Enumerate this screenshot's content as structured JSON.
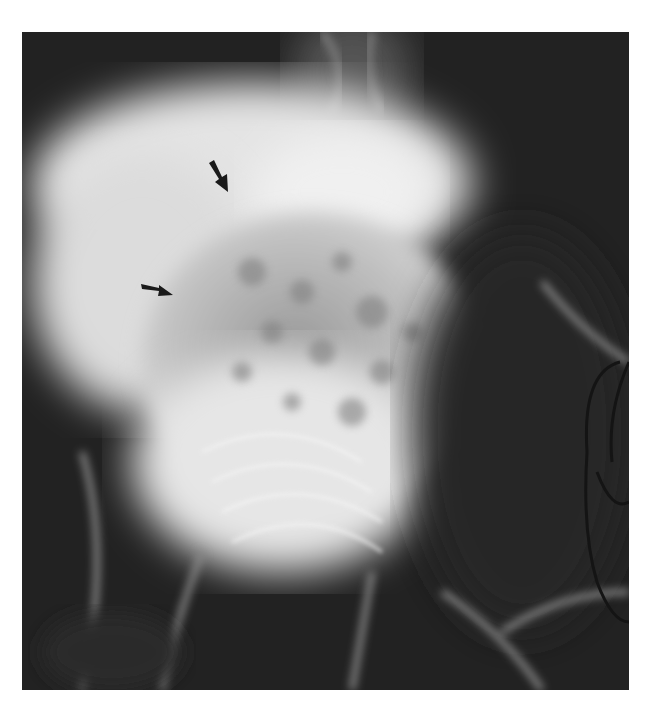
{
  "image": {
    "type": "radiograph",
    "description": "Grayscale X-ray of the abdomen/pelvis showing a large bright mottled mass with two black annotation arrows pointing at its margin; a curved dark tube/line at the right edge",
    "annotations": [
      {
        "name": "arrow-1",
        "direction": "down-right",
        "tail": [
          187,
          131
        ],
        "tip": [
          206,
          160
        ]
      },
      {
        "name": "arrow-2",
        "direction": "right",
        "tail": [
          119,
          254
        ],
        "tip": [
          151,
          263
        ]
      }
    ],
    "colors": {
      "background": "#ffffff",
      "film_dark": "#1e1e1e",
      "bright_mass": "#e8e8e8",
      "arrow": "#1a1a1a"
    }
  }
}
